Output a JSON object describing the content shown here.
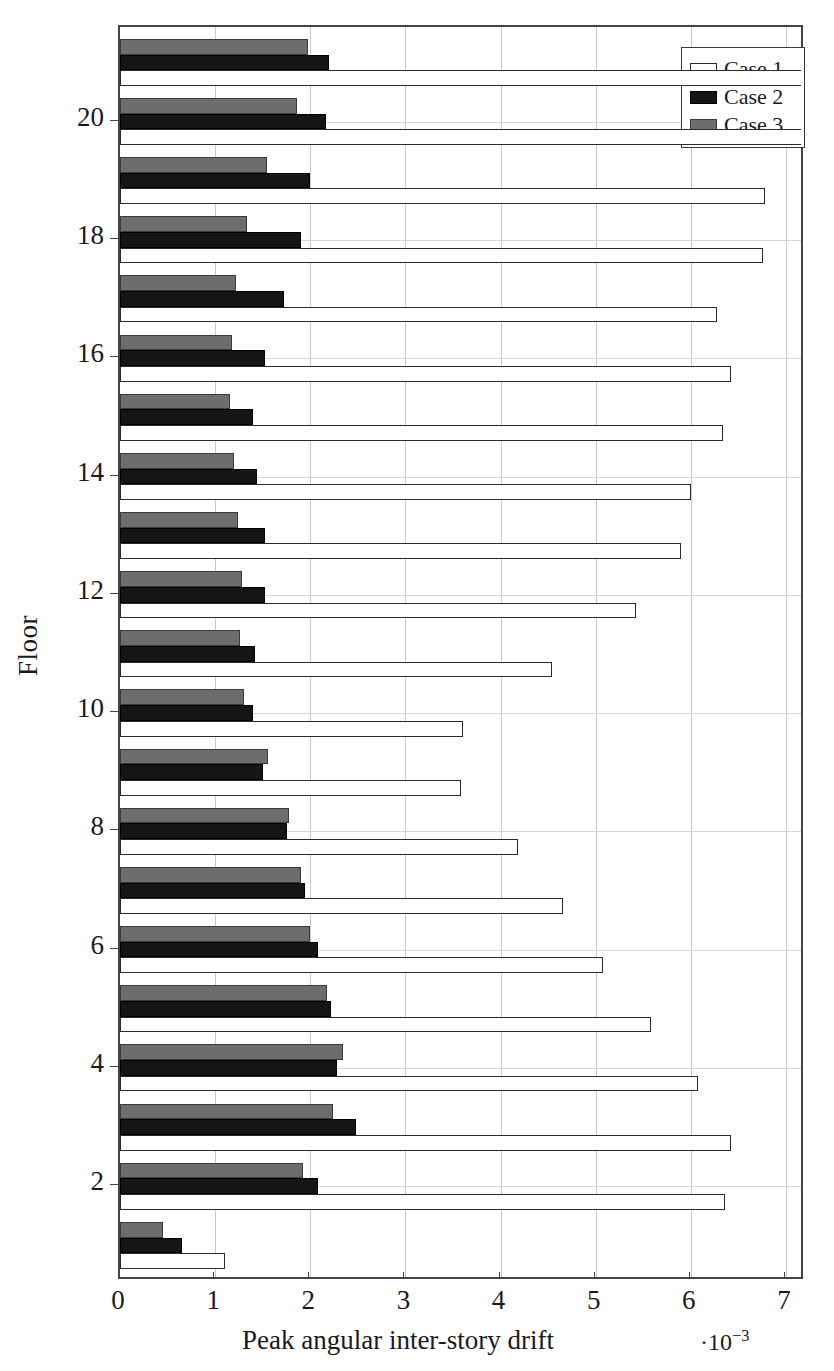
{
  "chart_data": {
    "type": "bar",
    "orientation": "horizontal",
    "title": "",
    "xlabel": "Peak angular inter-story drift",
    "xlabel_exponent": "·10⁻³",
    "ylabel": "Floor",
    "xlim": [
      0,
      7.2
    ],
    "ylim": [
      0.4,
      21.6
    ],
    "xticks": [
      0,
      1,
      2,
      3,
      4,
      5,
      6,
      7
    ],
    "xticklabels": [
      "0",
      "1",
      "2",
      "3",
      "4",
      "5",
      "6",
      "7"
    ],
    "yticks": [
      2,
      4,
      6,
      8,
      10,
      12,
      14,
      16,
      18,
      20
    ],
    "yticklabels": [
      "2",
      "4",
      "6",
      "8",
      "10",
      "12",
      "14",
      "16",
      "18",
      "20"
    ],
    "grid": true,
    "legend_position": "top-right",
    "categories": [
      1,
      2,
      3,
      4,
      5,
      6,
      7,
      8,
      9,
      10,
      11,
      12,
      13,
      14,
      15,
      16,
      17,
      18,
      19,
      20,
      21
    ],
    "series": [
      {
        "name": "Case 1",
        "color": "#ffffff",
        "edge_color": "#2b2b2b",
        "values": [
          1.1,
          6.36,
          6.42,
          6.08,
          5.58,
          5.08,
          4.66,
          4.18,
          3.58,
          3.6,
          4.54,
          5.42,
          5.9,
          6.0,
          6.34,
          6.42,
          6.28,
          6.76,
          6.78,
          7.4,
          7.4
        ]
      },
      {
        "name": "Case 2",
        "color": "#151515",
        "edge_color": "#000000",
        "values": [
          0.65,
          2.08,
          2.48,
          2.28,
          2.22,
          2.08,
          1.94,
          1.76,
          1.5,
          1.4,
          1.42,
          1.52,
          1.52,
          1.44,
          1.4,
          1.52,
          1.72,
          1.9,
          2.0,
          2.16,
          2.2
        ]
      },
      {
        "name": "Case 3",
        "color": "#6d6d6d",
        "edge_color": "#3b3b3b",
        "values": [
          0.45,
          1.92,
          2.24,
          2.34,
          2.18,
          2.0,
          1.9,
          1.78,
          1.56,
          1.3,
          1.26,
          1.28,
          1.24,
          1.2,
          1.16,
          1.18,
          1.22,
          1.34,
          1.54,
          1.86,
          1.98
        ]
      }
    ]
  },
  "legend": {
    "items": [
      {
        "label": "Case 1",
        "swatch": "c1"
      },
      {
        "label": "Case 2",
        "swatch": "c2"
      },
      {
        "label": "Case 3",
        "swatch": "c3"
      }
    ]
  }
}
